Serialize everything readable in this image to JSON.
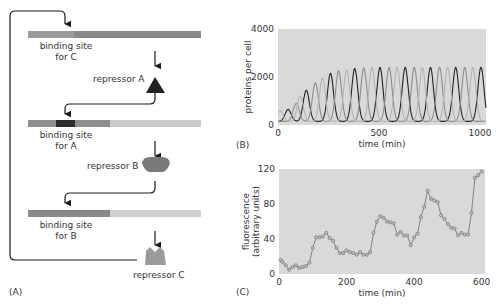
{
  "panel_a": {
    "label": "(A)",
    "genes": [
      {
        "site_label_line1": "binding site",
        "site_label_line2": "for C",
        "repressor_label": "repressor A",
        "repressor_shape": "triangle"
      },
      {
        "site_label_line1": "binding site",
        "site_label_line2": "for A",
        "repressor_label": "repressor B",
        "repressor_shape": "rounded-trapezoid"
      },
      {
        "site_label_line1": "binding site",
        "site_label_line2": "for B",
        "repressor_label": "repressor C",
        "repressor_shape": "notched-block"
      }
    ],
    "colors": {
      "dark_site": "#2b2b2b",
      "mid_gray": "#8a8a8a",
      "light_gray": "#c9c9c9",
      "arrow": "#1a1a1a",
      "repressor_b": "#7a7a7a",
      "repressor_c": "#9a9a9a"
    }
  },
  "panel_b": {
    "label": "(B)"
  },
  "panel_c": {
    "label": "(C)"
  },
  "chart_data": [
    {
      "id": "B",
      "type": "line",
      "title": "",
      "xlabel": "time (min)",
      "ylabel": "proteins per cell",
      "xlim": [
        0,
        1030
      ],
      "ylim": [
        0,
        4000
      ],
      "xticks": [
        0,
        500,
        1000
      ],
      "yticks": [
        0,
        2000,
        4000
      ],
      "grid": false,
      "background": "#d9d9d9",
      "description": "Three phase-shifted damped-onset oscillations (repressilator). Period ~125 min; amplitude grows from ~650 to ~2400 proteins per cell by ~400 min, then steady.",
      "period_min": 125,
      "series": [
        {
          "name": "repressor (black)",
          "color": "#222222",
          "phase_offset_min": 0,
          "peaks": [
            [
              50,
              650
            ],
            [
              140,
              1450
            ],
            [
              260,
              2150
            ],
            [
              380,
              2350
            ],
            [
              505,
              2400
            ],
            [
              630,
              2400
            ],
            [
              755,
              2400
            ],
            [
              880,
              2400
            ],
            [
              1005,
              2400
            ]
          ]
        },
        {
          "name": "repressor (gray)",
          "color": "#8c8c8c",
          "phase_offset_min": 42,
          "peaks": [
            [
              90,
              900
            ],
            [
              185,
              1750
            ],
            [
              300,
              2250
            ],
            [
              425,
              2380
            ],
            [
              550,
              2400
            ],
            [
              675,
              2400
            ],
            [
              800,
              2400
            ],
            [
              925,
              2400
            ]
          ]
        },
        {
          "name": "repressor (light gray)",
          "color": "#b3b3b3",
          "phase_offset_min": 84,
          "peaks": [
            [
              10,
              600
            ],
            [
              110,
              1200
            ],
            [
              220,
              1950
            ],
            [
              340,
              2300
            ],
            [
              465,
              2400
            ],
            [
              590,
              2400
            ],
            [
              715,
              2400
            ],
            [
              840,
              2400
            ],
            [
              965,
              2400
            ]
          ]
        }
      ]
    },
    {
      "id": "C",
      "type": "line",
      "title": "",
      "xlabel": "time (min)",
      "ylabel": "fluorescence\n(arbitrary units)",
      "ylabel_line1": "fluorescence",
      "ylabel_line2": "(arbitrary units)",
      "xlim": [
        0,
        610
      ],
      "ylim": [
        0,
        120
      ],
      "xticks": [
        0,
        200,
        400,
        600
      ],
      "yticks": [
        0,
        40,
        80,
        120
      ],
      "grid": false,
      "background": "#d9d9d9",
      "marker": "circle",
      "series": [
        {
          "name": "fluorescence",
          "color": "#777777",
          "x": [
            5,
            10,
            20,
            30,
            40,
            50,
            60,
            70,
            80,
            90,
            100,
            110,
            120,
            130,
            140,
            150,
            160,
            170,
            180,
            190,
            200,
            210,
            220,
            230,
            240,
            250,
            260,
            270,
            280,
            290,
            300,
            310,
            320,
            330,
            340,
            350,
            360,
            370,
            380,
            390,
            400,
            410,
            420,
            430,
            440,
            450,
            460,
            470,
            480,
            490,
            500,
            510,
            520,
            530,
            540,
            550,
            560,
            570,
            580,
            590,
            600
          ],
          "y": [
            16,
            14,
            10,
            5,
            8,
            10,
            7,
            8,
            9,
            13,
            30,
            42,
            42,
            43,
            47,
            41,
            38,
            30,
            24,
            24,
            27,
            25,
            24,
            22,
            25,
            22,
            22,
            25,
            47,
            60,
            66,
            64,
            60,
            59,
            58,
            45,
            48,
            44,
            44,
            33,
            42,
            46,
            65,
            77,
            95,
            86,
            84,
            82,
            67,
            63,
            57,
            53,
            52,
            44,
            47,
            45,
            45,
            70,
            110,
            113,
            117
          ]
        }
      ]
    }
  ]
}
